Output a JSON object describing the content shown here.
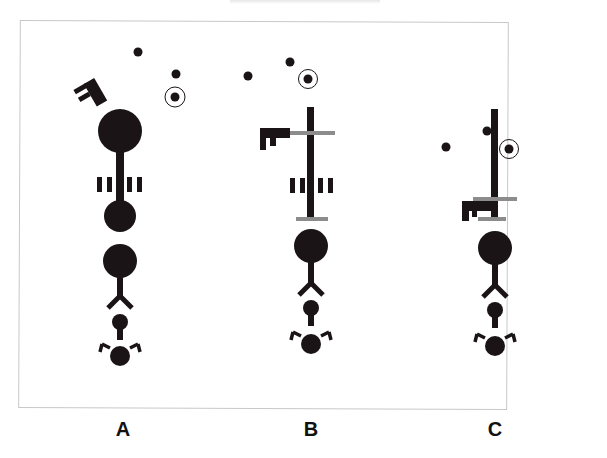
{
  "figure": {
    "panels": [
      {
        "id": "A",
        "label": "A",
        "key_state": "key-rotated-on-top-of-large-ball"
      },
      {
        "id": "B",
        "label": "B",
        "key_state": "key-attached-to-upper-gray-bar"
      },
      {
        "id": "C",
        "label": "C",
        "key_state": "key-lowered-to-bottom-gray-bar"
      }
    ],
    "colors": {
      "shape_fill": "#1a1416",
      "gray_bar": "#8c8c8c",
      "frame_border": "#c8c8c8",
      "background": "#ffffff"
    }
  }
}
